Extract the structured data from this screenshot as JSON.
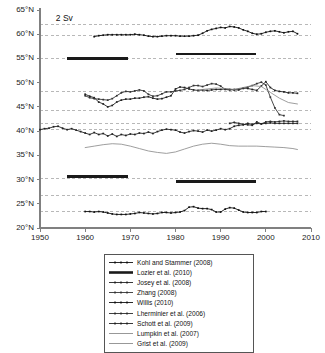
{
  "figure": {
    "scale_annotation": "2 Sv",
    "background": "#ffffff",
    "axis_color": "#808080",
    "grid_color": "#9a9a9a"
  },
  "legend": {
    "items": [
      {
        "label": "Kohl and Stammer (2008)",
        "style": "marker",
        "color": "#111111"
      },
      {
        "label": "Lozier et al. (2010)",
        "style": "thick",
        "color": "#1a1a1a"
      },
      {
        "label": "Josey et al. (2008)",
        "style": "marker",
        "color": "#222222"
      },
      {
        "label": "Zhang (2008)",
        "style": "marker",
        "color": "#333333"
      },
      {
        "label": "Willis (2010)",
        "style": "marker",
        "color": "#111111"
      },
      {
        "label": "Lherminier et al. (2006)",
        "style": "marker",
        "color": "#2a2a2a"
      },
      {
        "label": "Schott et al. (2009)",
        "style": "marker",
        "color": "#222222"
      },
      {
        "label": "Lumpkin et al. (2007)",
        "style": "plain",
        "color": "#8c8c8c"
      },
      {
        "label": "Grist et al. (2009)",
        "style": "plain",
        "color": "#8c8c8c"
      }
    ]
  },
  "chart_data": {
    "type": "line",
    "title": "",
    "xlabel": "",
    "ylabel": "",
    "xlim": [
      1950,
      2010
    ],
    "ylim": [
      20,
      65
    ],
    "xticks": [
      1950,
      1960,
      1970,
      1980,
      1990,
      2000,
      2010
    ],
    "yticks": [
      "20°N",
      "25°N",
      "30°N",
      "35°N",
      "40°N",
      "45°N",
      "50°N",
      "55°N",
      "60°N",
      "65°N"
    ],
    "ytick_values": [
      20,
      25,
      30,
      35,
      40,
      45,
      50,
      55,
      60,
      65
    ],
    "grid": "horizontal-dashed",
    "gridlines": [
      62,
      59.8,
      55,
      48.2,
      44.2,
      41.6,
      40.4,
      30.2,
      26.8,
      23.4
    ],
    "legend_position": "below-axes",
    "annotations": [
      {
        "text": "2 Sv",
        "x": 1953.5,
        "y": 63.3
      }
    ],
    "series": [
      {
        "name": "Kohl and Stammer (2008)",
        "style": "marker",
        "color": "#111111",
        "latitude_band": 60,
        "x": [
          1962,
          1963,
          1964,
          1965,
          1966,
          1967,
          1968,
          1969,
          1970,
          1971,
          1972,
          1973,
          1974,
          1975,
          1976,
          1977,
          1978,
          1979,
          1980,
          1981,
          1982,
          1983,
          1984,
          1985,
          1986,
          1987,
          1988,
          1989,
          1990,
          1991,
          1992,
          1993,
          1994,
          1995,
          1996,
          1997,
          1998,
          1999,
          2000,
          2001,
          2002,
          2003,
          2004,
          2005,
          2006,
          2007
        ],
        "y": [
          59.5,
          59.7,
          59.8,
          59.9,
          59.9,
          59.9,
          59.9,
          59.9,
          59.9,
          60.0,
          59.9,
          59.8,
          59.6,
          59.5,
          59.5,
          59.6,
          59.7,
          59.7,
          59.7,
          59.6,
          59.6,
          59.6,
          59.7,
          59.8,
          60.2,
          60.7,
          61.0,
          61.2,
          61.4,
          61.3,
          61.6,
          61.5,
          61.3,
          60.9,
          60.6,
          60.2,
          60.0,
          60.1,
          60.4,
          60.6,
          60.7,
          60.5,
          60.3,
          60.5,
          60.6,
          60.1
        ]
      },
      {
        "name": "Josey et al. (2008)",
        "style": "marker",
        "color": "#222222",
        "latitude_band": 48,
        "x": [
          1960,
          1961,
          1962,
          1963,
          1964,
          1965,
          1966,
          1967,
          1968,
          1969,
          1970,
          1971,
          1972,
          1973,
          1974,
          1975,
          1976,
          1977,
          1978,
          1979,
          1980,
          1981,
          1982,
          1983,
          1984,
          1985,
          1986,
          1987,
          1988,
          1989,
          1990,
          1991,
          1992,
          1993,
          1994,
          1995,
          1996,
          1997,
          1998,
          1999,
          2000,
          2001,
          2002,
          2003,
          2004,
          2005,
          2006,
          2007
        ],
        "y": [
          47.6,
          47.2,
          46.9,
          46.0,
          45.6,
          45.0,
          45.3,
          46.0,
          46.4,
          46.6,
          46.6,
          46.8,
          46.8,
          47.0,
          47.1,
          46.8,
          46.6,
          46.7,
          47.0,
          47.3,
          48.7,
          49.1,
          49.0,
          48.7,
          48.5,
          48.4,
          48.5,
          48.4,
          48.5,
          48.6,
          48.6,
          48.7,
          48.6,
          48.5,
          48.5,
          48.9,
          48.8,
          48.6,
          48.4,
          49.3,
          50.2,
          49.0,
          48.4,
          48.2,
          48.1,
          47.9,
          47.9,
          47.8
        ]
      },
      {
        "name": "Zhang (2008)",
        "style": "marker",
        "color": "#333333",
        "latitude_band": 48,
        "x": [
          1960,
          1961,
          1962,
          1963,
          1964,
          1965,
          1966,
          1967,
          1968,
          1969,
          1970,
          1971,
          1972,
          1973,
          1974,
          1975,
          1976,
          1977,
          1978,
          1979,
          1980,
          1981,
          1982,
          1983,
          1984,
          1985,
          1986,
          1987,
          1988,
          1989,
          1990,
          1991,
          1992,
          1993,
          1994,
          1995,
          1996,
          1997,
          1998,
          1999,
          2000,
          2001,
          2002,
          2003,
          2004
        ],
        "y": [
          47.3,
          46.9,
          46.7,
          46.6,
          46.5,
          46.4,
          46.7,
          47.3,
          47.9,
          48.2,
          48.1,
          48.3,
          48.5,
          48.3,
          47.6,
          47.2,
          47.3,
          47.7,
          48.1,
          48.1,
          48.3,
          48.4,
          48.6,
          49.0,
          49.4,
          49.4,
          49.2,
          49.5,
          49.8,
          49.7,
          49.3,
          48.6,
          48.5,
          48.6,
          48.7,
          48.8,
          49.1,
          49.4,
          49.8,
          50.1,
          49.5,
          47.0,
          44.8,
          43.4,
          43.2
        ]
      },
      {
        "name": "Lherminier et al. (2006)",
        "style": "marker",
        "color": "#2a2a2a",
        "latitude_band": 41,
        "x": [
          1992,
          1993,
          1994,
          1995,
          1996,
          1997,
          1998,
          1999,
          2000,
          2001,
          2002,
          2003,
          2004,
          2005,
          2006,
          2007
        ],
        "y": [
          41.6,
          41.8,
          41.6,
          41.4,
          41.3,
          41.2,
          41.9,
          41.5,
          41.9,
          42.0,
          41.9,
          42.0,
          42.1,
          42.0,
          42.0,
          42.0
        ]
      },
      {
        "name": "Schott et al. (2009)",
        "style": "marker",
        "color": "#222222",
        "latitude_band": 40,
        "x": [
          1950,
          1951,
          1952,
          1953,
          1954,
          1955,
          1956,
          1957,
          1958,
          1959,
          1960,
          1961,
          1962,
          1963,
          1964,
          1965,
          1966,
          1967,
          1968,
          1969,
          1970,
          1971,
          1972,
          1973,
          1974,
          1975,
          1976,
          1977,
          1978,
          1979,
          1980,
          1981,
          1982,
          1983,
          1984,
          1985,
          1986,
          1987,
          1988,
          1989,
          1990,
          1991,
          1992,
          1993,
          1994,
          1995,
          1996,
          1997,
          1998,
          1999,
          2000,
          2001,
          2002,
          2003,
          2004,
          2005,
          2006,
          2007
        ],
        "y": [
          40.3,
          40.5,
          40.6,
          40.9,
          41.0,
          40.6,
          40.3,
          40.5,
          40.2,
          39.9,
          39.6,
          39.3,
          39.7,
          39.3,
          39.5,
          39.0,
          39.4,
          38.9,
          39.3,
          39.1,
          39.4,
          39.3,
          39.6,
          39.5,
          39.8,
          39.5,
          39.9,
          40.2,
          40.4,
          40.3,
          40.2,
          39.8,
          39.6,
          39.9,
          40.1,
          40.0,
          39.8,
          40.2,
          40.0,
          40.2,
          40.5,
          40.3,
          40.5,
          41.0,
          41.2,
          41.3,
          41.6,
          41.4,
          41.6,
          41.5,
          41.6,
          41.7,
          41.6,
          41.6,
          41.6,
          41.6,
          41.6,
          41.6
        ]
      },
      {
        "name": "Lumpkin et al. (2007)",
        "style": "plain",
        "color": "#8c8c8c",
        "latitude_band": 36,
        "x": [
          1960,
          1962,
          1964,
          1966,
          1968,
          1970,
          1972,
          1974,
          1976,
          1978,
          1980,
          1982,
          1984,
          1986,
          1988,
          1990,
          1992,
          1994,
          1996,
          1998,
          2000,
          2002,
          2004,
          2006,
          2007
        ],
        "y": [
          36.6,
          36.9,
          37.2,
          37.4,
          37.3,
          36.9,
          36.4,
          35.9,
          35.6,
          35.4,
          35.7,
          36.3,
          36.9,
          37.3,
          37.5,
          37.3,
          37.0,
          36.9,
          36.9,
          36.9,
          36.8,
          36.7,
          36.6,
          36.4,
          36.2
        ]
      },
      {
        "name": "Grist et al. (2009)",
        "style": "plain",
        "color": "#8c8c8c",
        "latitude_band": 48,
        "x": [
          1985,
          1987,
          1989,
          1991,
          1993,
          1995,
          1997,
          1999,
          2001,
          2003,
          2005,
          2007
        ],
        "y": [
          48.5,
          48.7,
          48.9,
          48.8,
          48.6,
          49.0,
          49.4,
          49.2,
          48.0,
          46.8,
          45.9,
          45.6
        ]
      },
      {
        "name": "Willis (2010)",
        "style": "marker",
        "color": "#111111",
        "latitude_band": 24,
        "x": [
          1960,
          1961,
          1962,
          1963,
          1964,
          1965,
          1966,
          1967,
          1968,
          1969,
          1970,
          1971,
          1972,
          1973,
          1974,
          1975,
          1976,
          1977,
          1978,
          1979,
          1980,
          1981,
          1982,
          1983,
          1984,
          1985,
          1986,
          1987,
          1988,
          1989,
          1990,
          1991,
          1992,
          1993,
          1994,
          1995,
          1996,
          1997,
          1998,
          1999,
          2000
        ],
        "y": [
          23.4,
          23.4,
          23.3,
          23.4,
          23.3,
          23.1,
          22.9,
          22.8,
          22.8,
          22.8,
          22.9,
          23.0,
          23.2,
          23.1,
          23.0,
          22.9,
          23.0,
          23.2,
          23.2,
          23.1,
          23.2,
          23.3,
          23.6,
          24.3,
          24.4,
          24.1,
          24.0,
          24.0,
          23.8,
          23.3,
          23.3,
          23.9,
          24.2,
          24.1,
          23.7,
          23.3,
          23.2,
          23.2,
          23.2,
          23.4,
          23.4
        ]
      }
    ],
    "lozier_bars": [
      {
        "x_start": 1956.0,
        "x_end": 1969.5,
        "y": 55.0
      },
      {
        "x_start": 1980.2,
        "x_end": 1997.8,
        "y": 55.9
      },
      {
        "x_start": 1956.0,
        "x_end": 1969.5,
        "y": 30.6
      },
      {
        "x_start": 1980.2,
        "x_end": 1997.8,
        "y": 29.6
      }
    ]
  }
}
